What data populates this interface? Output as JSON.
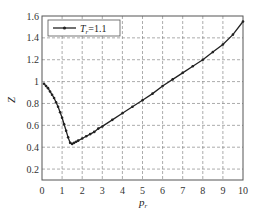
{
  "chart_data": {
    "type": "line",
    "title": "",
    "xlabel": "p_r",
    "ylabel": "Z",
    "xlim": [
      0,
      10
    ],
    "ylim": [
      0.1,
      1.6
    ],
    "xticks": [
      "0",
      "1",
      "2",
      "3",
      "4",
      "5",
      "6",
      "7",
      "8",
      "9",
      "10"
    ],
    "yticks": [
      "0.2",
      "0.4",
      "0.6",
      "0.8",
      "1",
      "1.2",
      "1.4",
      "1.6"
    ],
    "grid": true,
    "legend_position": "upper-left",
    "series": [
      {
        "name": "T_r=1.1",
        "marker": "dot",
        "color": "#222222",
        "x": [
          0.1,
          0.2,
          0.3,
          0.4,
          0.5,
          0.6,
          0.7,
          0.8,
          0.9,
          1.0,
          1.1,
          1.2,
          1.3,
          1.4,
          1.5,
          1.6,
          1.7,
          1.8,
          2.0,
          2.2,
          2.4,
          2.6,
          2.8,
          3.0,
          3.5,
          4.0,
          4.5,
          5.0,
          5.5,
          6.0,
          6.5,
          7.0,
          7.5,
          8.0,
          8.5,
          9.0,
          9.5,
          10.0
        ],
        "y": [
          0.98,
          0.96,
          0.94,
          0.91,
          0.88,
          0.85,
          0.81,
          0.77,
          0.72,
          0.67,
          0.61,
          0.55,
          0.49,
          0.44,
          0.43,
          0.44,
          0.45,
          0.46,
          0.48,
          0.5,
          0.52,
          0.54,
          0.57,
          0.59,
          0.65,
          0.71,
          0.77,
          0.83,
          0.89,
          0.96,
          1.02,
          1.08,
          1.14,
          1.2,
          1.27,
          1.34,
          1.43,
          1.55
        ]
      }
    ]
  },
  "legend": {
    "label_main": "T",
    "label_sub": "r",
    "label_rest": "=1.1"
  },
  "axes": {
    "xlabel_main": "p",
    "xlabel_sub": "r",
    "ylabel": "Z"
  }
}
